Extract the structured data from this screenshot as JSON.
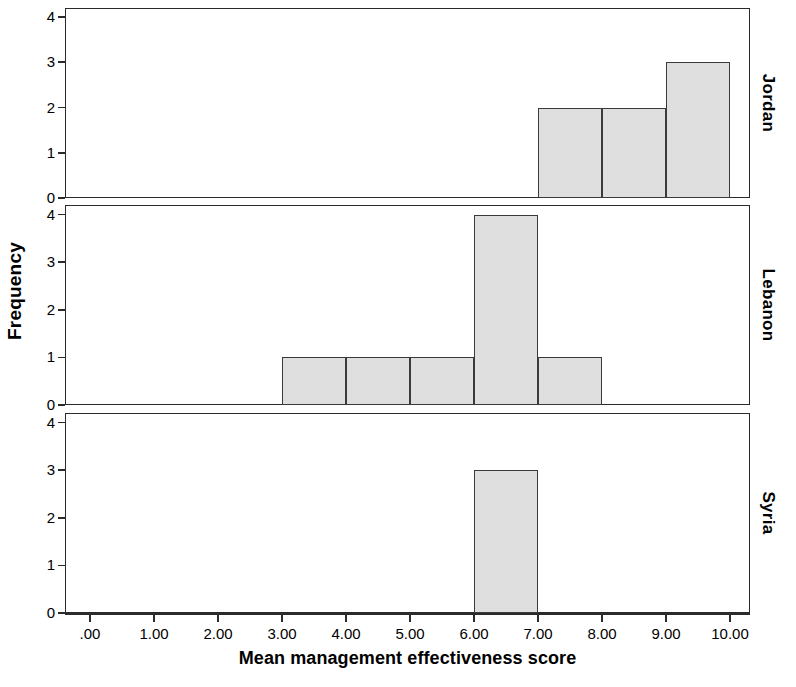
{
  "chart_data": {
    "type": "bar",
    "title": "",
    "subtitle": "",
    "xlabel": "Mean management effectiveness score",
    "ylabel": "Frequency",
    "xlim": [
      -0.4,
      10.6
    ],
    "ylim": [
      0,
      4.2
    ],
    "grid": false,
    "legend_position": "none",
    "bin_width": 1.0,
    "x_tick_values": [
      0,
      1,
      2,
      3,
      4,
      5,
      6,
      7,
      8,
      9,
      10
    ],
    "x_tick_labels": [
      ".00",
      "1.00",
      "2.00",
      "3.00",
      "4.00",
      "5.00",
      "6.00",
      "7.00",
      "8.00",
      "9.00",
      "10.00"
    ],
    "y_tick_values": [
      0,
      1,
      2,
      3,
      4
    ],
    "y_tick_labels": [
      "0",
      "1",
      "2",
      "3",
      "4"
    ],
    "panel_layout": "stacked-rows",
    "panel_label_position": "right",
    "panels": [
      {
        "label": "Jordan",
        "bars": [
          {
            "bin_start": 7,
            "bin_end": 8,
            "value": 2
          },
          {
            "bin_start": 8,
            "bin_end": 9,
            "value": 2
          },
          {
            "bin_start": 9,
            "bin_end": 10,
            "value": 3
          }
        ]
      },
      {
        "label": "Lebanon",
        "bars": [
          {
            "bin_start": 3,
            "bin_end": 4,
            "value": 1
          },
          {
            "bin_start": 4,
            "bin_end": 5,
            "value": 1
          },
          {
            "bin_start": 5,
            "bin_end": 6,
            "value": 1
          },
          {
            "bin_start": 6,
            "bin_end": 7,
            "value": 4
          },
          {
            "bin_start": 7,
            "bin_end": 8,
            "value": 1
          }
        ]
      },
      {
        "label": "Syria",
        "bars": [
          {
            "bin_start": 6,
            "bin_end": 7,
            "value": 3
          }
        ]
      }
    ],
    "colors": {
      "bar_fill": "#dcdcdc",
      "bar_border": "#3a3a3a",
      "axis": "#2b2b2b",
      "background": "#ffffff",
      "text": "#000000"
    }
  }
}
